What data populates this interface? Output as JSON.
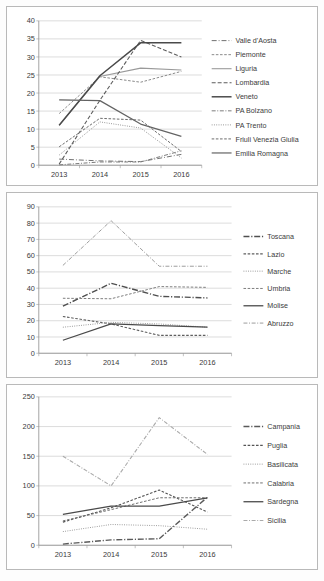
{
  "page": {
    "caption": ""
  },
  "chart_data": [
    {
      "type": "line",
      "title": "",
      "xlabel": "",
      "ylabel": "",
      "categories": [
        "2013",
        "2014",
        "2015",
        "2016"
      ],
      "x": [
        2013,
        2014,
        2015,
        2016
      ],
      "ylim": [
        0,
        40
      ],
      "yticks": [
        0,
        5,
        10,
        15,
        20,
        25,
        30,
        35,
        40
      ],
      "grid": true,
      "legend_position": "right",
      "series": [
        {
          "name": "Valle d'Aosta",
          "values": [
            1.7,
            1.2,
            1.0,
            3.0
          ],
          "dash": "long-dot",
          "color": "#6f6f6f",
          "width": 1.0
        },
        {
          "name": "Piemonte",
          "values": [
            14.3,
            24.5,
            23.0,
            26.0
          ],
          "dash": "dash-sm",
          "color": "#8a8a8a",
          "width": 1.0
        },
        {
          "name": "Liguria",
          "values": [
            11.0,
            24.6,
            26.9,
            26.4
          ],
          "dash": "solid",
          "color": "#9a9a9a",
          "width": 1.1
        },
        {
          "name": "Lombardia",
          "values": [
            0.3,
            18.0,
            34.6,
            30.0
          ],
          "dash": "dash-md",
          "color": "#5c5c5c",
          "width": 1.1
        },
        {
          "name": "Veneto",
          "values": [
            11.1,
            24.8,
            33.9,
            33.9
          ],
          "dash": "solid",
          "color": "#4a4a4a",
          "width": 1.5
        },
        {
          "name": "PA Bolzano",
          "values": [
            0.1,
            0.9,
            0.9,
            4.0
          ],
          "dash": "dashdot",
          "color": "#7a7a7a",
          "width": 1.0
        },
        {
          "name": "PA Trento",
          "values": [
            2.8,
            12.0,
            10.3,
            2.0
          ],
          "dash": "dot",
          "color": "#8f8f8f",
          "width": 1.0
        },
        {
          "name": "Friuli Venezia Giulia",
          "values": [
            5.1,
            13.0,
            12.5,
            3.8
          ],
          "dash": "dash-sm",
          "color": "#6a6a6a",
          "width": 1.0
        },
        {
          "name": "Emilia Romagna",
          "values": [
            18.1,
            17.9,
            11.4,
            8.0
          ],
          "dash": "solid",
          "color": "#636363",
          "width": 1.2
        }
      ]
    },
    {
      "type": "line",
      "title": "",
      "xlabel": "",
      "ylabel": "",
      "categories": [
        "2013",
        "2014",
        "2015",
        "2016"
      ],
      "x": [
        2013,
        2014,
        2015,
        2016
      ],
      "ylim": [
        0,
        90
      ],
      "yticks": [
        0,
        10,
        20,
        30,
        40,
        50,
        60,
        70,
        80,
        90
      ],
      "grid": true,
      "legend_position": "right",
      "series": [
        {
          "name": "Toscana",
          "values": [
            29.0,
            43.0,
            35.0,
            34.0
          ],
          "dash": "dashdot-lg",
          "color": "#4f4f4f",
          "width": 1.4
        },
        {
          "name": "Lazio",
          "values": [
            22.6,
            18.0,
            11.0,
            11.0
          ],
          "dash": "dash-sm",
          "color": "#5f5f5f",
          "width": 1.1
        },
        {
          "name": "Marche",
          "values": [
            16.0,
            19.0,
            18.0,
            16.0
          ],
          "dash": "dot",
          "color": "#909090",
          "width": 1.0
        },
        {
          "name": "Umbria",
          "values": [
            33.8,
            33.5,
            41.0,
            40.5
          ],
          "dash": "dash-sm",
          "color": "#7d7d7d",
          "width": 1.0
        },
        {
          "name": "Molise",
          "values": [
            8.0,
            18.0,
            17.0,
            16.0
          ],
          "dash": "solid",
          "color": "#4a4a4a",
          "width": 1.3
        },
        {
          "name": "Abruzzo",
          "values": [
            54.0,
            81.5,
            53.5,
            53.5
          ],
          "dash": "dashdot",
          "color": "#9c9c9c",
          "width": 1.0
        }
      ]
    },
    {
      "type": "line",
      "title": "",
      "xlabel": "",
      "ylabel": "",
      "categories": [
        "2013",
        "2014",
        "2015",
        "2016"
      ],
      "x": [
        2013,
        2014,
        2015,
        2016
      ],
      "ylim": [
        0,
        250
      ],
      "yticks": [
        0,
        50,
        100,
        150,
        200,
        250
      ],
      "grid": true,
      "legend_position": "right",
      "series": [
        {
          "name": "Campania",
          "values": [
            2.0,
            9.0,
            11.0,
            81.0
          ],
          "dash": "dashdot-lg",
          "color": "#5a5a5a",
          "width": 1.4
        },
        {
          "name": "Puglia",
          "values": [
            39.0,
            63.0,
            93.0,
            56.0
          ],
          "dash": "dash-sm",
          "color": "#555555",
          "width": 1.1
        },
        {
          "name": "Basilicata",
          "values": [
            23.0,
            35.0,
            33.0,
            27.0
          ],
          "dash": "dot",
          "color": "#949494",
          "width": 1.0
        },
        {
          "name": "Calabria",
          "values": [
            41.0,
            60.0,
            80.0,
            80.0
          ],
          "dash": "dash-sm",
          "color": "#6e6e6e",
          "width": 1.0
        },
        {
          "name": "Sardegna",
          "values": [
            52.0,
            66.0,
            66.0,
            80.0
          ],
          "dash": "solid",
          "color": "#4a4a4a",
          "width": 1.3
        },
        {
          "name": "Sicilia",
          "values": [
            150.0,
            100.0,
            215.0,
            153.0
          ],
          "dash": "dashdot",
          "color": "#aaaaaa",
          "width": 1.1
        }
      ]
    }
  ]
}
